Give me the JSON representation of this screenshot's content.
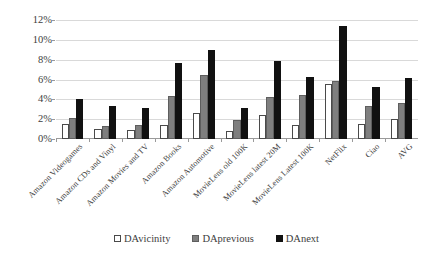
{
  "chart_data": {
    "type": "bar",
    "title": "",
    "xlabel": "",
    "ylabel": "",
    "ylim": [
      0,
      12
    ],
    "ytick_labels": [
      "0%",
      "2%",
      "4%",
      "6%",
      "8%",
      "10%",
      "12%"
    ],
    "ytick_values": [
      0,
      2,
      4,
      6,
      8,
      10,
      12
    ],
    "grid": true,
    "legend_position": "bottom",
    "categories": [
      "Amazon Videogames",
      "Amazon CDs and Vinyl",
      "Amazon Movies and TV",
      "Amazon Books",
      "Amazon Automotive",
      "MovieLens old 100K",
      "MovieLens latest 20M",
      "MovieLens Latest 100K",
      "NetFlix",
      "Ciao",
      "AVG"
    ],
    "series": [
      {
        "name": "DAvicinity",
        "color": "#ffffff",
        "values": [
          1.5,
          1.0,
          0.9,
          1.4,
          2.6,
          0.8,
          2.4,
          1.4,
          5.5,
          1.5,
          2.0
        ]
      },
      {
        "name": "DAprevious",
        "color": "#7f7f7f",
        "values": [
          2.1,
          1.3,
          1.4,
          4.3,
          6.5,
          1.9,
          4.2,
          4.4,
          5.9,
          3.3,
          3.6
        ]
      },
      {
        "name": "DAnext",
        "color": "#111111",
        "values": [
          4.0,
          3.3,
          3.1,
          7.7,
          9.0,
          3.1,
          7.9,
          6.3,
          11.4,
          5.2,
          6.2
        ]
      }
    ]
  }
}
